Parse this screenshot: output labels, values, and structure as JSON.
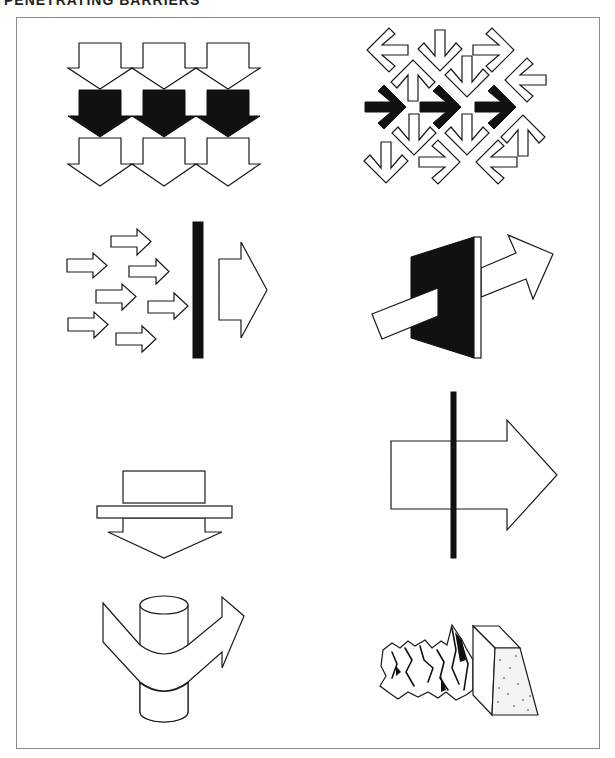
{
  "header": {
    "title": "PENETRATING BARRIERS",
    "title_right": ""
  },
  "colors": {
    "ink": "#111111",
    "paper": "#ffffff",
    "frame": "#8a8a8a"
  },
  "figures": [
    {
      "id": "stacked-down-arrows",
      "description": "Three rows of down-pointing block arrows; middle row filled black",
      "rows": [
        {
          "fill": "outline",
          "shaft_top": 43,
          "head_y": 68,
          "tip_y": 89
        },
        {
          "fill": "black",
          "shaft_top": 90,
          "head_y": 115,
          "tip_y": 137
        },
        {
          "fill": "outline",
          "shaft_top": 137,
          "head_y": 162,
          "tip_y": 186
        }
      ],
      "columns_x": [
        100,
        164,
        228
      ]
    },
    {
      "id": "chevron-arrow-field",
      "description": "Field of outlined chevron arrows in various directions with three black right-pointing arrows across the middle",
      "arrows": [
        {
          "x": 386,
          "y": 50,
          "dir": "left",
          "fill": "outline"
        },
        {
          "x": 440,
          "y": 52,
          "dir": "down",
          "fill": "outline"
        },
        {
          "x": 495,
          "y": 50,
          "dir": "right",
          "fill": "outline"
        },
        {
          "x": 413,
          "y": 79,
          "dir": "up",
          "fill": "outline"
        },
        {
          "x": 467,
          "y": 78,
          "dir": "down",
          "fill": "outline"
        },
        {
          "x": 524,
          "y": 80,
          "dir": "left",
          "fill": "outline"
        },
        {
          "x": 386,
          "y": 107,
          "dir": "right",
          "fill": "black"
        },
        {
          "x": 441,
          "y": 107,
          "dir": "right",
          "fill": "black"
        },
        {
          "x": 496,
          "y": 107,
          "dir": "right",
          "fill": "black"
        },
        {
          "x": 414,
          "y": 135,
          "dir": "down",
          "fill": "outline"
        },
        {
          "x": 467,
          "y": 136,
          "dir": "down",
          "fill": "outline"
        },
        {
          "x": 523,
          "y": 134,
          "dir": "up",
          "fill": "outline"
        },
        {
          "x": 386,
          "y": 164,
          "dir": "down",
          "fill": "outline"
        },
        {
          "x": 441,
          "y": 162,
          "dir": "right",
          "fill": "outline"
        },
        {
          "x": 495,
          "y": 162,
          "dir": "left",
          "fill": "outline"
        }
      ]
    },
    {
      "id": "scattered-arrows-to-one",
      "description": "Seven small scattered arrows converge on a black barrier; one large arrow emerges on the other side",
      "small_arrows": [
        {
          "x1": 111,
          "y1": 236,
          "x2": 137,
          "y2": 247,
          "tip": 151,
          "ht": 229,
          "hb": 255
        },
        {
          "x1": 67,
          "y1": 259,
          "x2": 93,
          "y2": 272,
          "tip": 107,
          "ht": 253,
          "hb": 278
        },
        {
          "x1": 129,
          "y1": 266,
          "x2": 156,
          "y2": 277,
          "tip": 169,
          "ht": 259,
          "hb": 284
        },
        {
          "x1": 96,
          "y1": 290,
          "x2": 122,
          "y2": 303,
          "tip": 136,
          "ht": 284,
          "hb": 310
        },
        {
          "x1": 148,
          "y1": 301,
          "x2": 174,
          "y2": 313,
          "tip": 188,
          "ht": 293,
          "hb": 319
        },
        {
          "x1": 68,
          "y1": 318,
          "x2": 94,
          "y2": 331,
          "tip": 108,
          "ht": 312,
          "hb": 338
        },
        {
          "x1": 116,
          "y1": 333,
          "x2": 142,
          "y2": 345,
          "tip": 156,
          "ht": 326,
          "hb": 352
        }
      ],
      "barrier": {
        "x": 193,
        "y": 222,
        "w": 10,
        "h": 136
      },
      "big_arrow": {
        "x1": 219,
        "y1": 259,
        "x2": 241,
        "y2": 320,
        "tip": 267,
        "ht": 242,
        "hb": 338
      }
    },
    {
      "id": "arrow-through-wall",
      "description": "Wide arrow penetrating a black wall in perspective"
    },
    {
      "id": "press-down",
      "description": "Block pressing down on a plate with down arrow below"
    },
    {
      "id": "arrow-through-rod",
      "description": "Large outlined right arrow crossed by a thin black vertical rod",
      "rod": {
        "x": 451,
        "y": 392,
        "w": 5,
        "h": 166
      },
      "arrow": {
        "x1": 391,
        "y1": 441,
        "x2": 507,
        "y2": 509,
        "tip": 557,
        "ht": 420,
        "hb": 530
      }
    },
    {
      "id": "arrow-wrapping-cylinder",
      "description": "Bent outlined arrow wrapping around a vertical cylinder"
    },
    {
      "id": "crumpled-against-block",
      "description": "Crumpled mass pressed against a stippled block"
    }
  ]
}
